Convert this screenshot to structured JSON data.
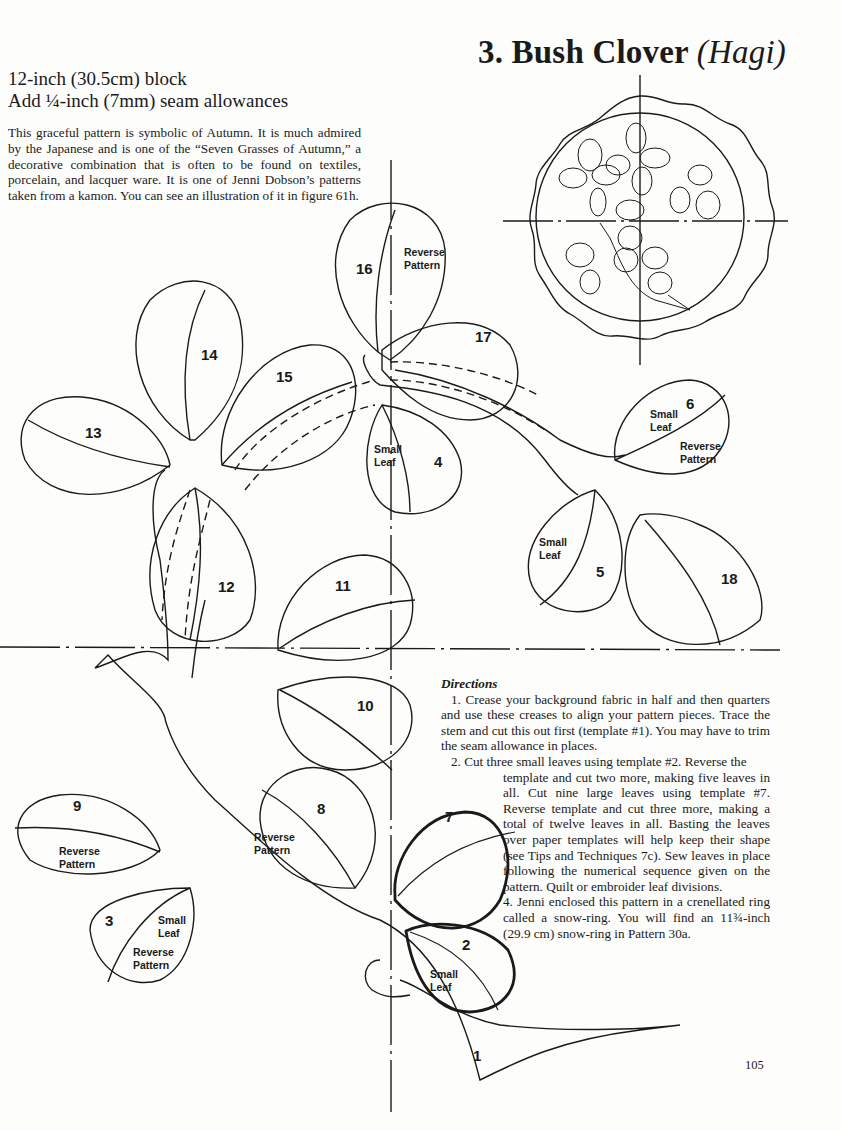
{
  "header": {
    "number": "3.",
    "title": "Bush Clover",
    "subtitle_italic": "(Hagi)"
  },
  "specs": {
    "block_size": "12-inch (30.5cm) block",
    "seam": "Add ¼-inch (7mm) seam allowances"
  },
  "intro": "This graceful pattern is symbolic of Autumn. It is much admired by the Japanese and is one of the “Seven Grasses of Autumn,” a decorative combination that is often to be found on textiles, porcelain, and lacquer ware. It is one of Jenni Dobson’s patterns taken from a kamon. You can see an illustration of it in figure 61h.",
  "pattern": {
    "pieces": [
      {
        "id": "1",
        "label": "1"
      },
      {
        "id": "2",
        "label": "2",
        "note": [
          "Small",
          "Leaf"
        ]
      },
      {
        "id": "3",
        "label": "3",
        "note": [
          "Small",
          "Leaf",
          "Reverse",
          "Pattern"
        ]
      },
      {
        "id": "4",
        "label": "4",
        "note": [
          "Small",
          "Leaf"
        ]
      },
      {
        "id": "5",
        "label": "5",
        "note": [
          "Small",
          "Leaf"
        ]
      },
      {
        "id": "6",
        "label": "6",
        "note": [
          "Small",
          "Leaf",
          "Reverse",
          "Pattern"
        ]
      },
      {
        "id": "7",
        "label": "7"
      },
      {
        "id": "8",
        "label": "8",
        "note": [
          "Reverse",
          "Pattern"
        ]
      },
      {
        "id": "9",
        "label": "9",
        "note": [
          "Reverse",
          "Pattern"
        ]
      },
      {
        "id": "10",
        "label": "10"
      },
      {
        "id": "11",
        "label": "11"
      },
      {
        "id": "12",
        "label": "12"
      },
      {
        "id": "13",
        "label": "13"
      },
      {
        "id": "14",
        "label": "14"
      },
      {
        "id": "15",
        "label": "15"
      },
      {
        "id": "16",
        "label": "16",
        "note": [
          "Reverse",
          "Pattern"
        ]
      },
      {
        "id": "17",
        "label": "17"
      },
      {
        "id": "18",
        "label": "18"
      }
    ],
    "notes": {
      "small": "Small",
      "leaf": "Leaf",
      "reverse": "Reverse",
      "pattern": "Pattern"
    }
  },
  "directions": {
    "heading": "Directions",
    "steps": [
      "1. Crease your background fabric in half and then quarters and use these creases to align your pattern pieces. Trace the stem and cut this out first (template #1). You may have to trim the seam allowance in places.",
      "2. Cut three small leaves using template #2. Reverse the",
      "template and cut two more, making five leaves in all. Cut nine large leaves using template #7. Reverse template and cut three more, making a total of twelve leaves in all. Basting the leaves over paper templates will help keep their shape (see Tips and Techniques 7c). Sew leaves in place following the numerical sequence given on the pattern. Quilt or embroider leaf divisions.",
      "4. Jenni enclosed this pattern in a crenellated ring called a snow-ring. You will find an 11¾-inch (29.9 cm) snow-ring in Pattern 30a."
    ]
  },
  "page_number": "105"
}
